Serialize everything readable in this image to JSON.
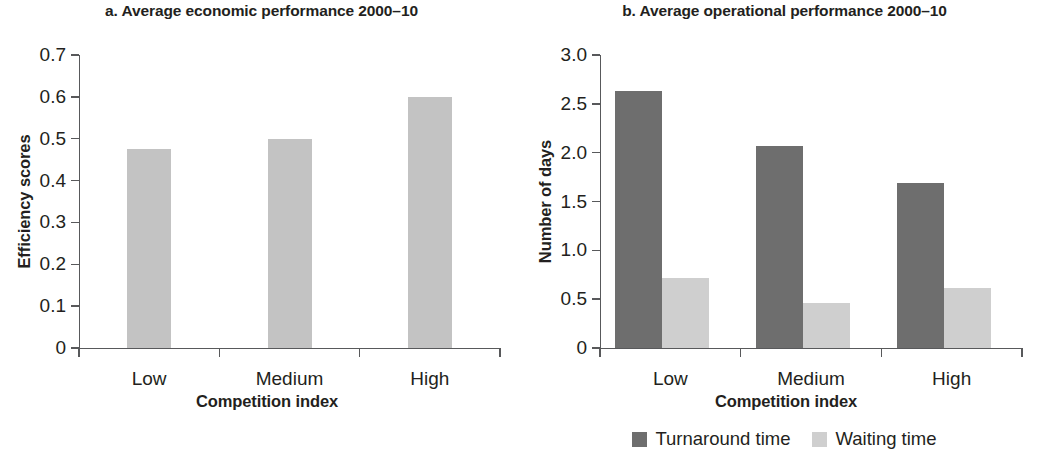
{
  "figure": {
    "background_color": "#ffffff",
    "text_color": "#231f20",
    "axis_color": "#58595b"
  },
  "panels": [
    {
      "id": "a",
      "title": "a. Average economic performance 2000–10",
      "ylabel": "Efficiency scores",
      "xlabel": "Competition index",
      "yticks": [
        "0",
        "0.1",
        "0.2",
        "0.3",
        "0.4",
        "0.5",
        "0.6",
        "0.7"
      ],
      "categories": [
        "Low",
        "Medium",
        "High"
      ],
      "series": [
        {
          "name": "Efficiency scores",
          "color": "#c3c3c3",
          "values": [
            0.475,
            0.5,
            0.6
          ]
        }
      ]
    },
    {
      "id": "b",
      "title": "b. Average operational performance 2000–10",
      "ylabel": "Number of days",
      "xlabel": "Competition index",
      "yticks": [
        "0",
        "0.5",
        "1.0",
        "1.5",
        "2.0",
        "2.5",
        "3.0"
      ],
      "categories": [
        "Low",
        "Medium",
        "High"
      ],
      "series": [
        {
          "name": "Turnaround time",
          "color": "#6e6e6e",
          "values": [
            2.63,
            2.07,
            1.69
          ]
        },
        {
          "name": "Waiting time",
          "color": "#cfcfcf",
          "values": [
            0.72,
            0.46,
            0.61
          ]
        }
      ],
      "legend": [
        {
          "label": "Turnaround time",
          "color": "#6e6e6e"
        },
        {
          "label": "Waiting time",
          "color": "#cfcfcf"
        }
      ]
    }
  ],
  "chart_data": [
    {
      "type": "bar",
      "title": "a. Average economic performance 2000–10",
      "xlabel": "Competition index",
      "ylabel": "Efficiency scores",
      "categories": [
        "Low",
        "Medium",
        "High"
      ],
      "values": [
        0.475,
        0.5,
        0.6
      ],
      "ylim": [
        0,
        0.7
      ],
      "yticks": [
        0,
        0.1,
        0.2,
        0.3,
        0.4,
        0.5,
        0.6,
        0.7
      ],
      "grid": false,
      "legend": null,
      "bar_color": "#c3c3c3"
    },
    {
      "type": "bar",
      "title": "b. Average operational performance 2000–10",
      "xlabel": "Competition index",
      "ylabel": "Number of days",
      "categories": [
        "Low",
        "Medium",
        "High"
      ],
      "series": [
        {
          "name": "Turnaround time",
          "values": [
            2.63,
            2.07,
            1.69
          ],
          "color": "#6e6e6e"
        },
        {
          "name": "Waiting time",
          "values": [
            0.72,
            0.46,
            0.61
          ],
          "color": "#cfcfcf"
        }
      ],
      "ylim": [
        0,
        3.0
      ],
      "yticks": [
        0,
        0.5,
        1.0,
        1.5,
        2.0,
        2.5,
        3.0
      ],
      "grid": false,
      "legend_position": "bottom-center"
    }
  ]
}
